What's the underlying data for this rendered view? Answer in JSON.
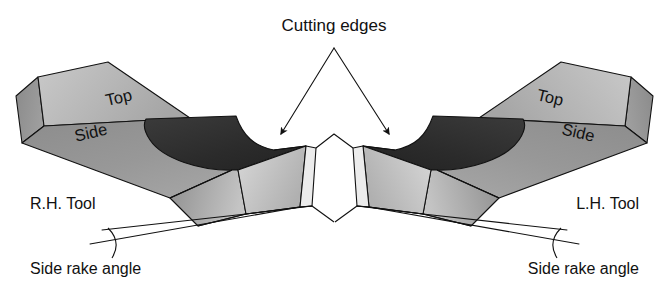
{
  "figure": {
    "title_label": "Cutting edges",
    "background_color": "#ffffff",
    "ink_color": "#111111"
  },
  "annotations": {
    "cutting_edges": "Cutting edges",
    "right_hand_tool": "R.H. Tool",
    "left_hand_tool": "L.H. Tool",
    "side_rake_angle_left": "Side rake angle",
    "side_rake_angle_right": "Side rake angle"
  },
  "left_tool": {
    "name": "R.H. Tool",
    "top_face_label": "Top",
    "side_face_label": "Side"
  },
  "right_tool": {
    "name": "L.H. Tool",
    "top_face_label": "Top",
    "side_face_label": "Side"
  },
  "palette": {
    "top_face": "#b4b4b4",
    "top_face_light": "#c8c8c8",
    "side_face": "#8e8e8e",
    "side_face_dark": "#7c7c7c",
    "end_face": "#9a9a9a",
    "rake_pocket": "#2b2b2b",
    "rake_pocket_light": "#3e3e3e",
    "flank_light": "#d2d2d2",
    "flank_mid": "#a6a6a6",
    "flank_dark": "#8a8a8a",
    "nose_face": "#e2e2e2",
    "outline": "#111111"
  }
}
